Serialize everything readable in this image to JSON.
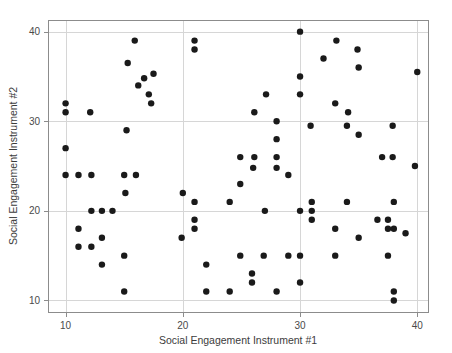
{
  "chart_data": {
    "type": "scatter",
    "title": "",
    "xlabel": "Social Engagement Instrument #1",
    "ylabel": "Social Engagement Instrument #2",
    "xlim": [
      8.5,
      41.0
    ],
    "ylim": [
      8.6,
      41.3
    ],
    "xticks": [
      10,
      20,
      30,
      40
    ],
    "yticks": [
      10,
      20,
      30,
      40
    ],
    "xtick_labels": [
      "10",
      "20",
      "30",
      "40"
    ],
    "ytick_labels": [
      "10",
      "20",
      "30",
      "40"
    ],
    "grid": true,
    "legend": null,
    "marker": "circle",
    "marker_color": "#1a1a1a",
    "marker_size": 3.2,
    "background_color": "#ffffff",
    "grid_color": "#d6d6d6",
    "border_color": "#8c8c8c",
    "points": [
      [
        10,
        32
      ],
      [
        10,
        31
      ],
      [
        10,
        27
      ],
      [
        10,
        24
      ],
      [
        11.1,
        24
      ],
      [
        11.1,
        18
      ],
      [
        11.1,
        16
      ],
      [
        12.1,
        31
      ],
      [
        12.2,
        24
      ],
      [
        12.2,
        20
      ],
      [
        12.2,
        16
      ],
      [
        13.1,
        20
      ],
      [
        13.1,
        17
      ],
      [
        13.1,
        14
      ],
      [
        14,
        20
      ],
      [
        15,
        24
      ],
      [
        15,
        15
      ],
      [
        15,
        11
      ],
      [
        15.1,
        22
      ],
      [
        15.2,
        29
      ],
      [
        15.3,
        36.5
      ],
      [
        15.9,
        39
      ],
      [
        16,
        24
      ],
      [
        16.2,
        34
      ],
      [
        16.7,
        34.8
      ],
      [
        17.1,
        33
      ],
      [
        17.3,
        32
      ],
      [
        17.5,
        35.3
      ],
      [
        19.9,
        17
      ],
      [
        20,
        22
      ],
      [
        21,
        39
      ],
      [
        21,
        38
      ],
      [
        21,
        21
      ],
      [
        21,
        19
      ],
      [
        21,
        18
      ],
      [
        22,
        14
      ],
      [
        22,
        11
      ],
      [
        24,
        21
      ],
      [
        24,
        11
      ],
      [
        24.9,
        26
      ],
      [
        24.9,
        23
      ],
      [
        24.9,
        15
      ],
      [
        25.9,
        13
      ],
      [
        25.9,
        12
      ],
      [
        26,
        24.8
      ],
      [
        26.1,
        31
      ],
      [
        26.1,
        26
      ],
      [
        26.9,
        15
      ],
      [
        27,
        20
      ],
      [
        27.1,
        33
      ],
      [
        28,
        30
      ],
      [
        28,
        28
      ],
      [
        28,
        26
      ],
      [
        28,
        24.8
      ],
      [
        28,
        11
      ],
      [
        29,
        24
      ],
      [
        29,
        15
      ],
      [
        30,
        40
      ],
      [
        30,
        35
      ],
      [
        30,
        33
      ],
      [
        30,
        20
      ],
      [
        30,
        15
      ],
      [
        30,
        12
      ],
      [
        30.9,
        29.5
      ],
      [
        31,
        21
      ],
      [
        31,
        20
      ],
      [
        31,
        19
      ],
      [
        32,
        37
      ],
      [
        33,
        32
      ],
      [
        33,
        18
      ],
      [
        33,
        15
      ],
      [
        33.1,
        39
      ],
      [
        34,
        29.5
      ],
      [
        34,
        21
      ],
      [
        34.1,
        31
      ],
      [
        34.9,
        38
      ],
      [
        35,
        36
      ],
      [
        35,
        28.5
      ],
      [
        35,
        17
      ],
      [
        36.6,
        19
      ],
      [
        37,
        26
      ],
      [
        37.5,
        19
      ],
      [
        37.5,
        18
      ],
      [
        37.5,
        15
      ],
      [
        37.9,
        29.5
      ],
      [
        37.9,
        26
      ],
      [
        38,
        21
      ],
      [
        38,
        18
      ],
      [
        38,
        11
      ],
      [
        38,
        10
      ],
      [
        39,
        17.5
      ],
      [
        39.8,
        25
      ],
      [
        40,
        35.5
      ]
    ],
    "n_points": 91
  }
}
